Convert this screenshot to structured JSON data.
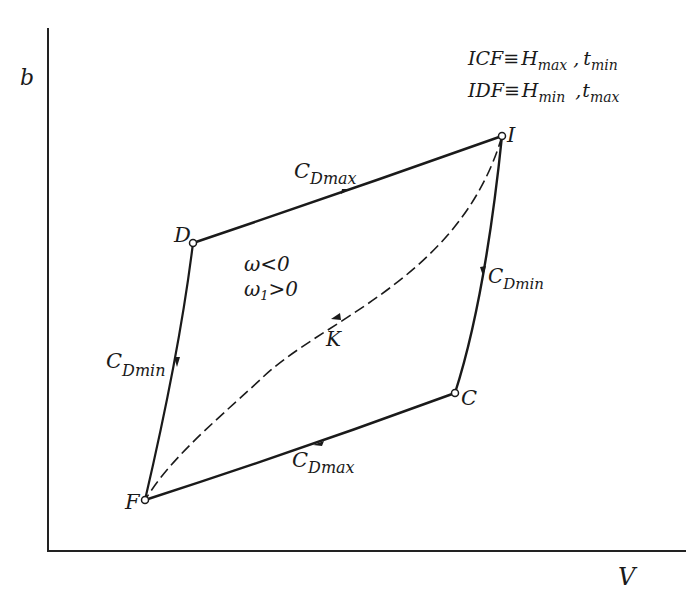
{
  "axes": {
    "y_label": "b",
    "x_label": "V"
  },
  "legend": {
    "line1": {
      "path": "ICF",
      "equiv": "≡",
      "H": "H",
      "H_sub": "max",
      "sep": " ,",
      "t": "t",
      "t_sub": "min"
    },
    "line2": {
      "path": "IDF",
      "equiv": "≡",
      "H": "H",
      "H_sub": "min",
      "sep": " ,",
      "t": "t",
      "t_sub": "max"
    }
  },
  "points": {
    "I": "I",
    "D": "D",
    "C": "C",
    "F": "F",
    "K": "K"
  },
  "segments": {
    "ID": {
      "C": "C",
      "sub": "Dmax"
    },
    "IC": {
      "C": "C",
      "sub": "Dmin"
    },
    "DF": {
      "C": "C",
      "sub": "Dmin"
    },
    "CF": {
      "C": "C",
      "sub": "Dmax"
    }
  },
  "conditions": {
    "line1": "ω<0",
    "line2_omega": "ω",
    "line2_sub": "1",
    "line2_rest": ">0"
  }
}
